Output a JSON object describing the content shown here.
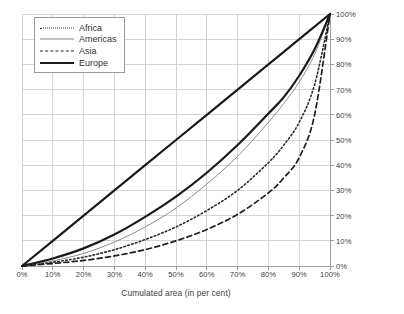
{
  "chart_data": {
    "type": "line",
    "title": "",
    "subtitle": "",
    "xlabel": "Cumulated area (in per cent)",
    "ylabel": "Cumulated population (in per cent)",
    "xlim": [
      0,
      100
    ],
    "ylim": [
      0,
      100
    ],
    "grid": true,
    "legend_position": "top-left",
    "y_axis_side": "right",
    "x_ticks": [
      "0%",
      "10%",
      "20%",
      "30%",
      "40%",
      "50%",
      "60%",
      "70%",
      "80%",
      "90%",
      "100%"
    ],
    "y_ticks": [
      "0%",
      "10%",
      "20%",
      "30%",
      "40%",
      "50%",
      "60%",
      "70%",
      "80%",
      "90%",
      "100%"
    ],
    "x_tick_values": [
      0,
      10,
      20,
      30,
      40,
      50,
      60,
      70,
      80,
      90,
      100
    ],
    "y_tick_values": [
      0,
      10,
      20,
      30,
      40,
      50,
      60,
      70,
      80,
      90,
      100
    ],
    "x": [
      0,
      10,
      20,
      30,
      40,
      50,
      60,
      70,
      80,
      85,
      90,
      95,
      100
    ],
    "series": [
      {
        "name": "Africa",
        "style": "dotted",
        "color": "#2b2b2b",
        "width": 1.6,
        "values": [
          0,
          1.5,
          3.5,
          6.5,
          10.5,
          15.5,
          22,
          30,
          41,
          48,
          57,
          72,
          100
        ]
      },
      {
        "name": "Americas",
        "style": "solid-thin",
        "color": "#8c8c8c",
        "width": 1.0,
        "values": [
          0,
          2,
          5,
          9.5,
          15.5,
          23,
          32.5,
          43.5,
          57,
          64.5,
          73,
          84,
          100
        ]
      },
      {
        "name": "Asia",
        "style": "dashed",
        "color": "#1e1e1e",
        "width": 1.7,
        "values": [
          0,
          1,
          2.2,
          4,
          6.5,
          10,
          14.5,
          20.5,
          29,
          35,
          43,
          60,
          100
        ]
      },
      {
        "name": "Europe",
        "style": "solid-thick",
        "color": "#1a1a1a",
        "width": 2.2,
        "values": [
          0,
          3,
          7,
          12.5,
          19.5,
          27.5,
          37,
          48,
          60.5,
          67,
          75.5,
          86,
          100
        ]
      },
      {
        "name": "Equality line",
        "style": "solid-thick",
        "color": "#1a1a1a",
        "width": 2.2,
        "values": [
          0,
          10,
          20,
          30,
          40,
          50,
          60,
          70,
          80,
          85,
          90,
          95,
          100
        ],
        "in_legend": false
      }
    ]
  },
  "legend": {
    "items": [
      {
        "label": "Africa"
      },
      {
        "label": "Americas"
      },
      {
        "label": "Asia"
      },
      {
        "label": "Europe"
      }
    ]
  },
  "axes": {
    "x_title": "Cumulated area (in per cent)",
    "y_title": "Cumulated population (in per cent)"
  }
}
